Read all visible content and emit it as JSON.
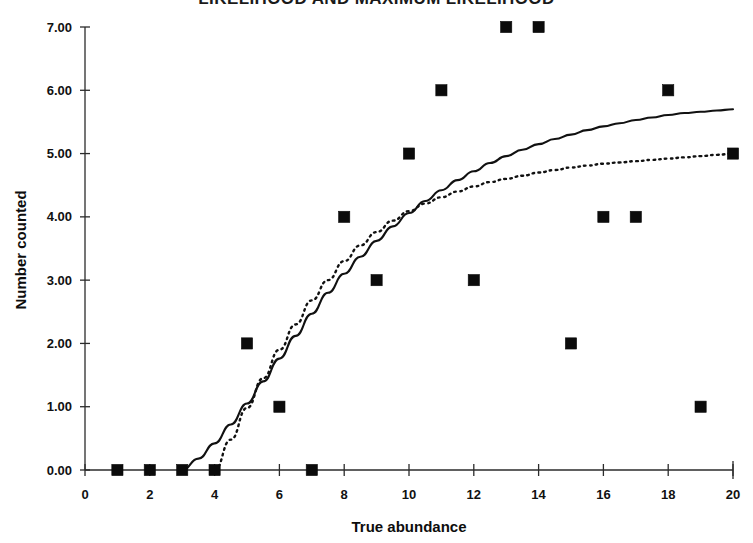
{
  "chart_data": {
    "type": "scatter",
    "title": "LIKELIHOOD AND MAXIMUM LIKELIHOOD",
    "xlabel": "True abundance",
    "ylabel": "Number counted",
    "xlim": [
      0,
      20
    ],
    "ylim": [
      0,
      7
    ],
    "grid": false,
    "legend": "none",
    "x_ticks": [
      "0",
      "2",
      "4",
      "6",
      "8",
      "10",
      "12",
      "14",
      "16",
      "18",
      "20"
    ],
    "x_tick_values": [
      0,
      2,
      4,
      6,
      8,
      10,
      12,
      14,
      16,
      18,
      20
    ],
    "x_minor_tick_values": [
      1,
      3,
      5,
      7,
      9,
      11,
      13,
      15,
      17,
      19
    ],
    "y_ticks": [
      "0.00",
      "1.00",
      "2.00",
      "3.00",
      "4.00",
      "5.00",
      "6.00",
      "7.00"
    ],
    "y_tick_values": [
      0,
      1,
      2,
      3,
      4,
      5,
      6,
      7
    ],
    "series": [
      {
        "name": "observed points",
        "style": "square-marker",
        "color": "#0b0b0b",
        "x": [
          1,
          2,
          3,
          4,
          5,
          6,
          7,
          8,
          9,
          10,
          11,
          12,
          13,
          14,
          15,
          16,
          17,
          18,
          19,
          20
        ],
        "values": [
          0,
          0,
          0,
          0,
          2,
          1,
          0,
          4,
          3,
          5,
          6,
          3,
          7,
          7,
          2,
          4,
          4,
          6,
          1,
          5
        ]
      },
      {
        "name": "likelihood fit",
        "style": "solid-line",
        "color": "#111111",
        "x": [
          3.0,
          3.5,
          4.0,
          4.5,
          5.0,
          5.5,
          6.0,
          6.5,
          7.0,
          7.5,
          8.0,
          8.5,
          9.0,
          9.5,
          10.0,
          10.5,
          11.0,
          11.5,
          12.0,
          12.5,
          13.0,
          13.5,
          14.0,
          14.5,
          15.0,
          15.5,
          16.0,
          16.5,
          17.0,
          17.5,
          18.0,
          18.5,
          19.0,
          19.5,
          20.0
        ],
        "values": [
          0.0,
          0.18,
          0.42,
          0.72,
          1.05,
          1.4,
          1.76,
          2.12,
          2.47,
          2.8,
          3.1,
          3.37,
          3.62,
          3.85,
          4.06,
          4.25,
          4.42,
          4.58,
          4.72,
          4.85,
          4.96,
          5.06,
          5.15,
          5.23,
          5.3,
          5.37,
          5.43,
          5.48,
          5.53,
          5.57,
          5.61,
          5.64,
          5.66,
          5.68,
          5.7
        ]
      },
      {
        "name": "maximum likelihood fit",
        "style": "dotted-line",
        "color": "#111111",
        "x": [
          4.0,
          4.5,
          5.0,
          5.5,
          6.0,
          6.5,
          7.0,
          7.5,
          8.0,
          8.5,
          9.0,
          9.5,
          10.0,
          10.5,
          11.0,
          11.5,
          12.0,
          12.5,
          13.0,
          13.5,
          14.0,
          14.5,
          15.0,
          15.5,
          16.0,
          16.5,
          17.0,
          17.5,
          18.0,
          18.5,
          19.0,
          19.5,
          20.0
        ],
        "values": [
          0.0,
          0.48,
          0.98,
          1.45,
          1.9,
          2.3,
          2.68,
          3.0,
          3.3,
          3.55,
          3.76,
          3.94,
          4.09,
          4.21,
          4.31,
          4.4,
          4.48,
          4.55,
          4.6,
          4.65,
          4.7,
          4.74,
          4.78,
          4.81,
          4.84,
          4.86,
          4.88,
          4.9,
          4.92,
          4.94,
          4.96,
          4.98,
          5.0
        ]
      }
    ]
  }
}
